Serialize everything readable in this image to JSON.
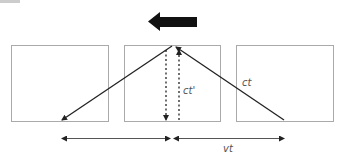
{
  "diagram": {
    "type": "light-clock-time-dilation",
    "motion_arrow": {
      "direction": "left",
      "color": "#111111"
    },
    "frames": [
      {
        "id": "left-frame"
      },
      {
        "id": "middle-frame"
      },
      {
        "id": "right-frame"
      }
    ],
    "labels": {
      "stationary_path": "ct'",
      "moving_path": "ct",
      "displacement": "vt"
    },
    "colors": {
      "box_stroke": "#aaaaaa",
      "line": "#222222",
      "label": "#555555"
    }
  }
}
